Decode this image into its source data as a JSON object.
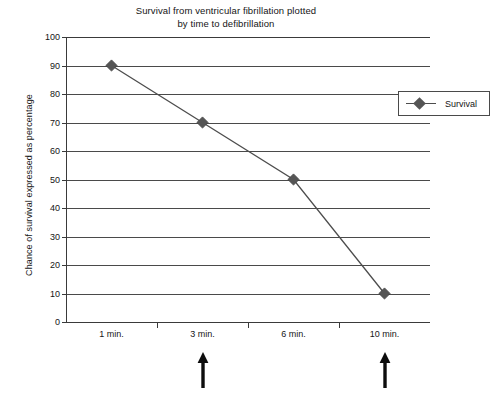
{
  "chart_data": {
    "type": "line",
    "title": "Survival from ventricular fibrillation plotted by time to defibrillation",
    "title_line1": "Survival from ventricular fibrillation plotted",
    "title_line2": "by time to defibrillation",
    "xlabel": "",
    "ylabel": "Chance of survival expressed as percentage",
    "categories": [
      "1 min.",
      "3 min.",
      "6 min.",
      "10 min."
    ],
    "values": [
      90,
      70,
      50,
      10
    ],
    "series": [
      {
        "name": "Survival",
        "values": [
          90,
          70,
          50,
          10
        ]
      }
    ],
    "ylim": [
      0,
      100
    ],
    "ytick_step": 10,
    "yticks": [
      100,
      90,
      80,
      70,
      60,
      50,
      40,
      30,
      20,
      10,
      0
    ],
    "ytick_labels": [
      "100",
      "90",
      "80",
      "70",
      "60",
      "50",
      "40",
      "30",
      "20",
      "10",
      "0"
    ],
    "grid": "horizontal",
    "legend_position": "top-right",
    "legend_entries": [
      "Survival"
    ],
    "marker": "diamond",
    "annotations": [
      {
        "label": "arrow-up",
        "at_category": "3 min."
      },
      {
        "label": "arrow-up",
        "at_category": "10 min."
      }
    ],
    "colors": {
      "line": "#4d4d4d",
      "marker": "#555555",
      "grid": "#4a4a4a",
      "axis": "#3a3a3a",
      "text": "#151515",
      "background": "#ffffff"
    }
  }
}
